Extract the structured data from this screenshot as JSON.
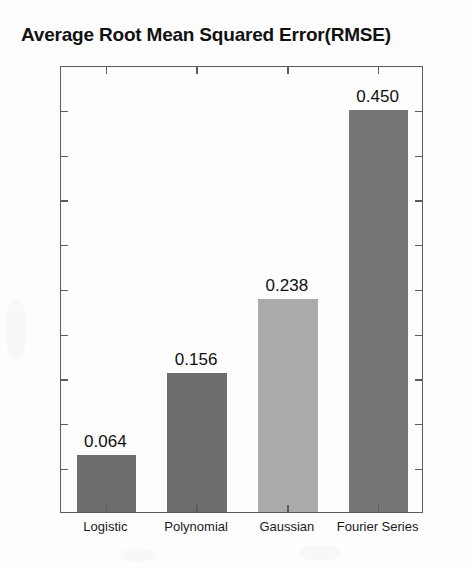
{
  "chart_data": {
    "type": "bar",
    "title": "Average Root Mean Squared Error(RMSE)",
    "xlabel": "",
    "ylabel": "",
    "categories": [
      "Logistic",
      "Polynomial",
      "Gaussian",
      "Fourier Series"
    ],
    "values": [
      0.064,
      0.156,
      0.238,
      0.45
    ],
    "value_labels": [
      "0.064",
      "0.156",
      "0.238",
      "0.450"
    ],
    "bar_colors": [
      "#6d6d6d",
      "#6d6d6d",
      "#ababab",
      "#757575"
    ],
    "ylim": [
      0,
      0.5
    ],
    "ytick_values": [
      0,
      0.05,
      0.1,
      0.15,
      0.2,
      0.25,
      0.3,
      0.35,
      0.4,
      0.45,
      0.5
    ],
    "ytick_labels": [
      "0",
      "0.05",
      "0.1",
      "0.15",
      "0.2",
      "0.25",
      "0.3",
      "0.35",
      "0.4",
      "0.45",
      "0.5"
    ],
    "grid": false,
    "legend": null,
    "axis_style": "box",
    "tick_direction": "in",
    "axis_color": "#5b5b5b",
    "background_color": "#fdfdfd"
  }
}
